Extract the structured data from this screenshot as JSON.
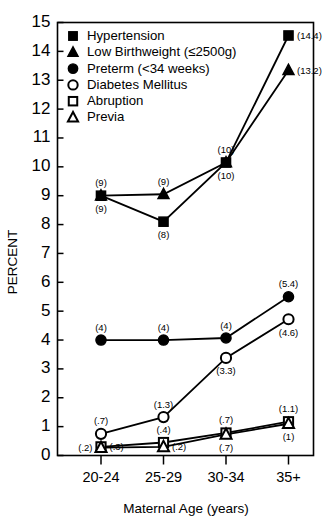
{
  "chart_data": {
    "type": "line",
    "title": "",
    "subtitle": "",
    "xlabel": "Maternal Age (years)",
    "ylabel": "PERCENT",
    "categories": [
      "20-24",
      "25-29",
      "30-34",
      "35+"
    ],
    "ylim": [
      0,
      15
    ],
    "ytick_values": [
      0,
      1,
      2,
      3,
      4,
      5,
      6,
      7,
      8,
      9,
      10,
      11,
      12,
      13,
      14,
      15
    ],
    "ytick_labels": [
      "0",
      "1",
      "2",
      "3",
      "4",
      "5",
      "6",
      "7",
      "8",
      "9",
      "10",
      "11",
      "12",
      "13",
      "14",
      "15"
    ],
    "grid": false,
    "legend_position": "upper-left-inside",
    "series": [
      {
        "name": "Hypertension",
        "marker": "filled-square",
        "values": [
          9,
          8.1,
          10.15,
          14.55
        ],
        "point_labels": [
          "(9)",
          "(8)",
          "(10)",
          "(14.4)"
        ],
        "label_positions": [
          "below",
          "below",
          "below",
          "right"
        ]
      },
      {
        "name": "Low Birthweight (≤2500g)",
        "marker": "filled-triangle",
        "values": [
          9,
          9.05,
          10.15,
          13.35
        ],
        "point_labels": [
          "(9)",
          "(9)",
          "(10)",
          "(13.2)"
        ],
        "label_positions": [
          "above",
          "above",
          "above",
          "right"
        ]
      },
      {
        "name": "Preterm (<34 weeks)",
        "marker": "filled-circle",
        "values": [
          4.0,
          4.0,
          4.07,
          5.5
        ],
        "point_labels": [
          "(4)",
          "(4)",
          "(4)",
          "(5.4)"
        ],
        "label_positions": [
          "above",
          "above",
          "above",
          "above"
        ]
      },
      {
        "name": "Diabetes Mellitus",
        "marker": "open-circle",
        "values": [
          0.75,
          1.33,
          3.38,
          4.72
        ],
        "point_labels": [
          "(.7)",
          "(1.3)",
          "(3.3)",
          "(4.6)"
        ],
        "label_positions": [
          "above",
          "above",
          "below",
          "below"
        ]
      },
      {
        "name": "Abruption",
        "marker": "open-square",
        "values": [
          0.3,
          0.45,
          0.78,
          1.17
        ],
        "point_labels": [
          "(.3)",
          "(.4)",
          "(.7)",
          "(1.1)"
        ],
        "label_positions": [
          "right",
          "above",
          "above",
          "above"
        ]
      },
      {
        "name": "Previa",
        "marker": "open-triangle",
        "values": [
          0.27,
          0.3,
          0.73,
          1.1
        ],
        "point_labels": [
          "(.2)",
          "(.2)",
          "(.7)",
          "(1)"
        ],
        "label_positions": [
          "left",
          "right",
          "below",
          "below"
        ]
      }
    ]
  },
  "legend": {
    "items": [
      {
        "label": "Hypertension",
        "marker": "filled-square"
      },
      {
        "label": "Low Birthweight (≤2500g)",
        "marker": "filled-triangle"
      },
      {
        "label": "Preterm (<34 weeks)",
        "marker": "filled-circle"
      },
      {
        "label": "Diabetes Mellitus",
        "marker": "open-circle"
      },
      {
        "label": "Abruption",
        "marker": "open-square"
      },
      {
        "label": "Previa",
        "marker": "open-triangle"
      }
    ]
  },
  "axes": {
    "y_title": "PERCENT",
    "x_title": "Maternal Age (years)"
  },
  "colors": {
    "ink": "#000000",
    "background": "#ffffff"
  }
}
